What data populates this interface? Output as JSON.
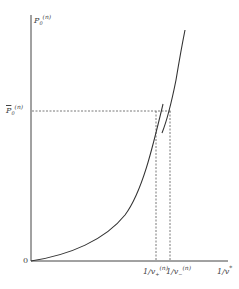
{
  "figure": {
    "y_axis_label": {
      "base": "P",
      "sub": "0",
      "sup": "(n)"
    },
    "level_label": {
      "base": "P",
      "sub": "0",
      "sup": "(n)",
      "overline": true
    },
    "origin_label": "0",
    "x_ticks": [
      {
        "base": "1/v",
        "sub": "+",
        "sup": "(n)"
      },
      {
        "base": "1/v",
        "sub": "−",
        "sup": "(n)"
      }
    ],
    "x_axis_label": {
      "base": "1/v",
      "sup": "*"
    },
    "colors": {
      "line": "#333333",
      "dash": "#555555",
      "background": "#ffffff"
    }
  }
}
